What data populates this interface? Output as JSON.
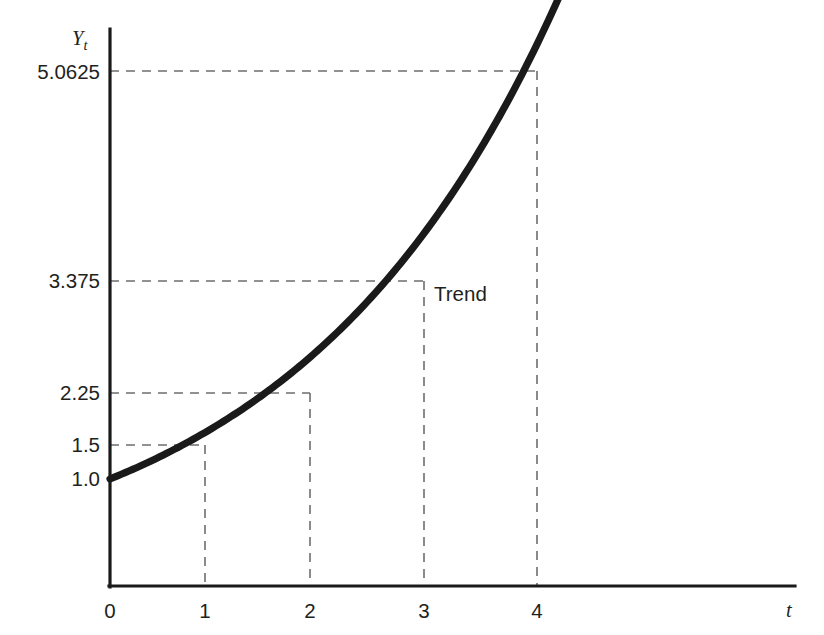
{
  "chart_data": {
    "type": "line",
    "title": "",
    "subtitle": "",
    "xlabel": "t",
    "ylabel": "Yt",
    "ylabel_base": "Y",
    "ylabel_sub": "t",
    "x": [
      0,
      1,
      2,
      3,
      4
    ],
    "values": [
      1.0,
      1.5,
      2.25,
      3.375,
      5.0625
    ],
    "series": [
      {
        "name": "Trend",
        "values": [
          1.0,
          1.5,
          2.25,
          3.375,
          5.0625
        ]
      }
    ],
    "x_tick_labels": [
      "0",
      "1",
      "2",
      "3",
      "4"
    ],
    "y_tick_labels": [
      "5.0625",
      "3.375",
      "2.25",
      "1.5",
      "1.0"
    ],
    "y_tick_values": [
      5.0625,
      3.375,
      2.25,
      1.5,
      1.0
    ],
    "xlim": [
      0,
      7.2
    ],
    "ylim": [
      0,
      5.85
    ],
    "grid": false,
    "guide_lines": "dashed drop-lines from each data point to both axes",
    "legend": "inline annotation",
    "annotations": [
      {
        "text": "Trend",
        "x": 3.0,
        "y": 3.375
      }
    ],
    "curve_color": "#1a1a1a",
    "guide_color": "#6e6e72",
    "axis_color": "#1a1a1a",
    "background_color": "#ffffff",
    "growth_factor": 1.5,
    "equation": "Yt = 1.0 x 1.5^t"
  },
  "axes": {
    "y_axis_name": "Y",
    "y_axis_subscript": "t",
    "x_axis_name": "t"
  },
  "labels": {
    "trend": "Trend",
    "y0": "5.0625",
    "y1": "3.375",
    "y2": "2.25",
    "y3": "1.5",
    "y4": "1.0",
    "x0": "0",
    "x1": "1",
    "x2": "2",
    "x3": "3",
    "x4": "4"
  }
}
